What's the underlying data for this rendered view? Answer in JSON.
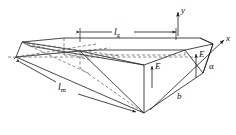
{
  "figure": {
    "type": "technical-line-diagram",
    "background_color": "#ffffff",
    "line_color": "#1a1a1a",
    "dashed_line_color": "#555555",
    "labels": {
      "length_g": {
        "symbol": "l",
        "subscript": "g",
        "text": "lg"
      },
      "length_m": {
        "symbol": "l",
        "subscript": "m",
        "text": "lm"
      },
      "field_upper": {
        "text": "E"
      },
      "field_lower": {
        "text": "E"
      },
      "width_b": {
        "text": "b"
      },
      "angle_alpha": {
        "text": "α"
      },
      "axis_x": {
        "text": "x"
      },
      "axis_y": {
        "text": "y"
      }
    },
    "axes": [
      {
        "name": "x",
        "label": "x",
        "direction": "upper-right"
      },
      {
        "name": "y",
        "label": "y",
        "direction": "up"
      }
    ],
    "dimensions": [
      {
        "name": "lg",
        "label": "lg",
        "style": "double-arrow-horizontal"
      },
      {
        "name": "lm",
        "label": "lm",
        "style": "double-arrow-diagonal"
      },
      {
        "name": "b",
        "label": "b",
        "style": "plain-edge-label"
      }
    ],
    "vectors": [
      {
        "name": "E-upper",
        "label": "E",
        "style": "single-arrow-up"
      },
      {
        "name": "E-lower",
        "label": "E",
        "style": "single-arrow-up"
      }
    ],
    "angles": [
      {
        "name": "alpha",
        "label": "α"
      }
    ]
  }
}
